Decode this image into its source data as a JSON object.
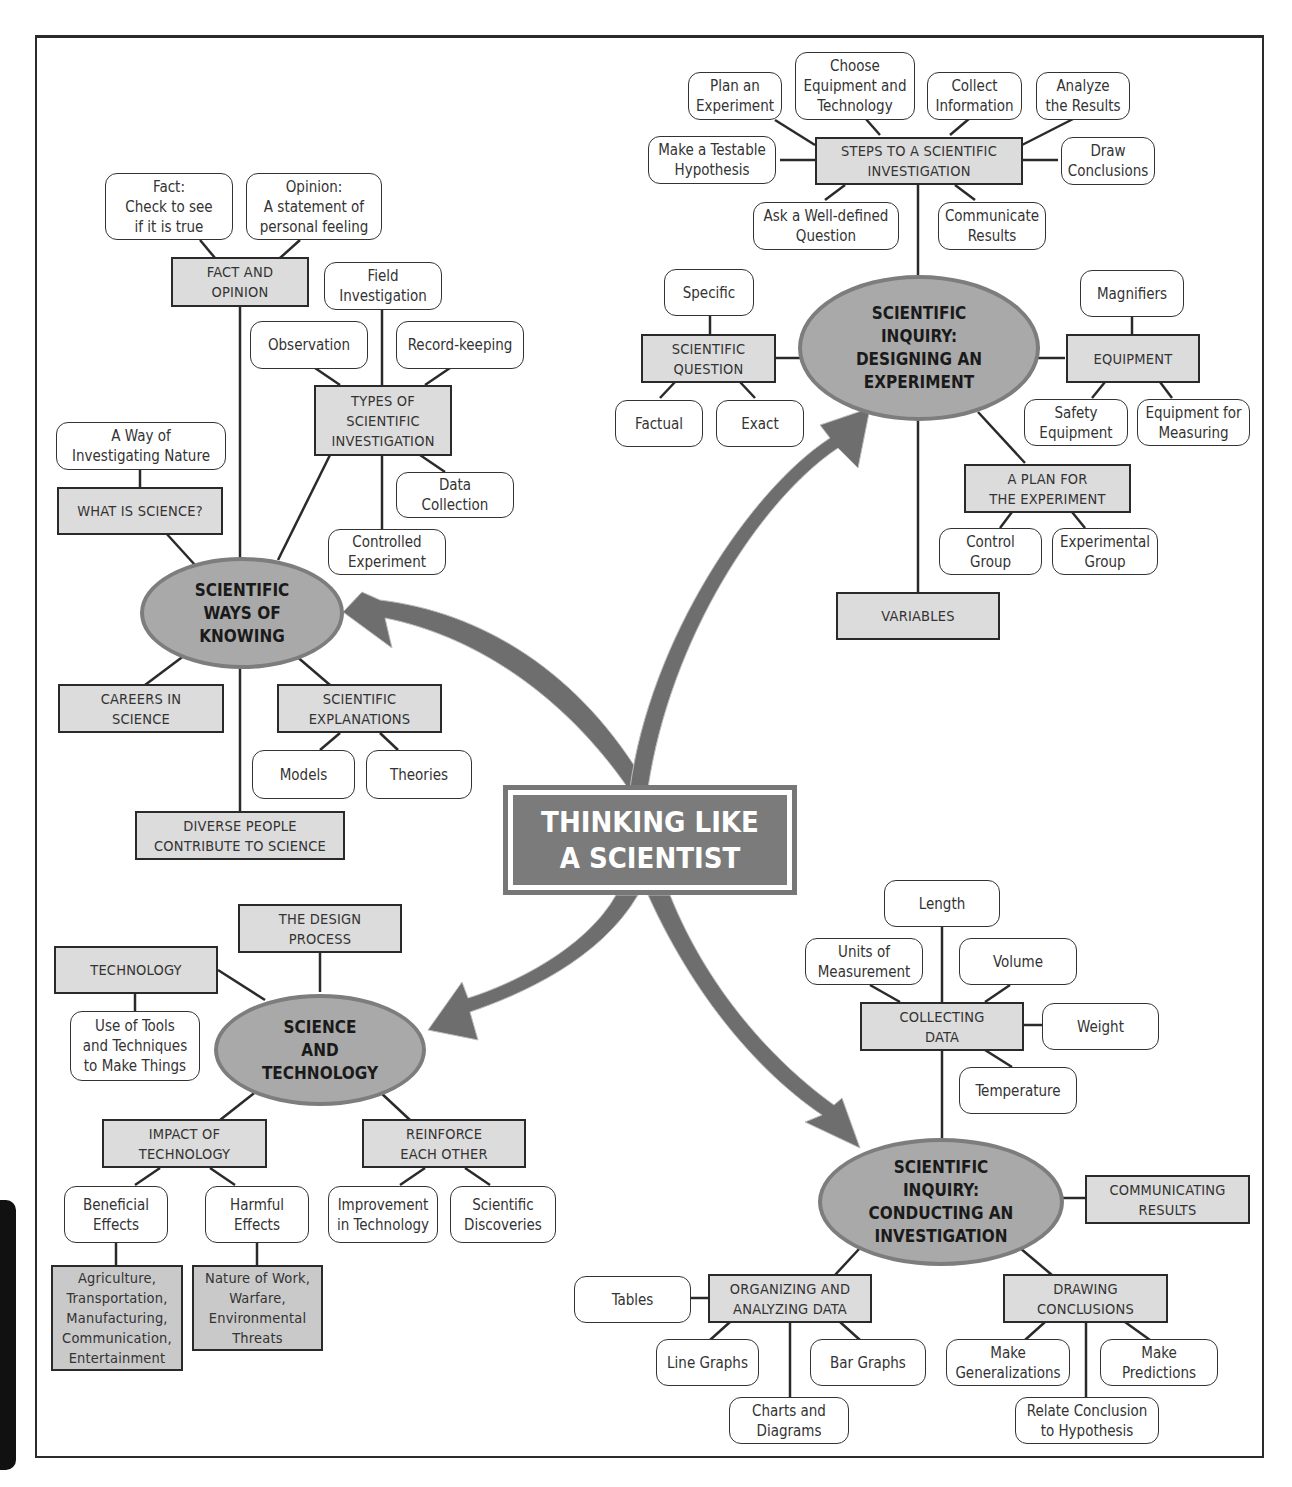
{
  "title": "THINKING LIKE\nA SCIENTIST",
  "colors": {
    "hub_fill": "#a9a9a9",
    "hub_border": "#7d7d7d",
    "box_fill": "#dcdcdc",
    "arrow": "#6e6e6e",
    "center_fill": "#7b7b7b"
  },
  "hubs": {
    "ways_of_knowing": "SCIENTIFIC\nWAYS OF\nKNOWING",
    "designing": "SCIENTIFIC\nINQUIRY:\nDESIGNING AN\nEXPERIMENT",
    "science_tech": "SCIENCE\nAND\nTECHNOLOGY",
    "conducting": "SCIENTIFIC\nINQUIRY:\nCONDUCTING AN\nINVESTIGATION"
  },
  "ways_of_knowing": {
    "fact_opinion": {
      "label": "FACT AND\nOPINION",
      "fact": "Fact:\nCheck to see\nif it is true",
      "opinion": "Opinion:\nA statement of\npersonal feeling"
    },
    "what_is_science": {
      "label": "WHAT IS SCIENCE?",
      "child": "A Way of\nInvestigating Nature"
    },
    "types": {
      "label": "TYPES OF\nSCIENTIFIC\nINVESTIGATION",
      "field": "Field\nInvestigation",
      "observation": "Observation",
      "record": "Record-keeping",
      "data": "Data\nCollection",
      "controlled": "Controlled\nExperiment"
    },
    "careers": "CAREERS IN\nSCIENCE",
    "explanations": {
      "label": "SCIENTIFIC\nEXPLANATIONS",
      "models": "Models",
      "theories": "Theories"
    },
    "diverse": "DIVERSE PEOPLE\nCONTRIBUTE TO SCIENCE"
  },
  "designing": {
    "steps": {
      "label": "STEPS TO A SCIENTIFIC\nINVESTIGATION",
      "items": [
        "Plan an\nExperiment",
        "Choose\nEquipment and\nTechnology",
        "Collect\nInformation",
        "Analyze\nthe Results",
        "Make a Testable\nHypothesis",
        "Draw\nConclusions",
        "Ask a Well-defined\nQuestion",
        "Communicate\nResults"
      ]
    },
    "question": {
      "label": "SCIENTIFIC\nQUESTION",
      "specific": "Specific",
      "factual": "Factual",
      "exact": "Exact"
    },
    "equipment": {
      "label": "EQUIPMENT",
      "magnifiers": "Magnifiers",
      "safety": "Safety\nEquipment",
      "measuring": "Equipment for\nMeasuring"
    },
    "plan": {
      "label": "A PLAN FOR\nTHE EXPERIMENT",
      "control": "Control\nGroup",
      "experimental": "Experimental\nGroup"
    },
    "variables": "VARIABLES"
  },
  "science_tech": {
    "design_process": "THE DESIGN\nPROCESS",
    "technology": {
      "label": "TECHNOLOGY",
      "child": "Use of Tools\nand Techniques\nto Make Things"
    },
    "impact": {
      "label": "IMPACT OF\nTECHNOLOGY",
      "beneficial": "Beneficial\nEffects",
      "harmful": "Harmful\nEffects",
      "beneficial_list": "Agriculture,\nTransportation,\nManufacturing,\nCommunication,\nEntertainment",
      "harmful_list": "Nature of Work,\nWarfare,\nEnvironmental\nThreats"
    },
    "reinforce": {
      "label": "REINFORCE\nEACH OTHER",
      "improvement": "Improvement\nin Technology",
      "discoveries": "Scientific\nDiscoveries"
    }
  },
  "conducting": {
    "collecting": {
      "label": "COLLECTING\nDATA",
      "length": "Length",
      "units": "Units of\nMeasurement",
      "volume": "Volume",
      "weight": "Weight",
      "temperature": "Temperature"
    },
    "communicating": "COMMUNICATING\nRESULTS",
    "organizing": {
      "label": "ORGANIZING AND\nANALYZING DATA",
      "tables": "Tables",
      "line": "Line Graphs",
      "bar": "Bar Graphs",
      "charts": "Charts and\nDiagrams"
    },
    "drawing": {
      "label": "DRAWING\nCONCLUSIONS",
      "generalizations": "Make\nGeneralizations",
      "predictions": "Make\nPredictions",
      "relate": "Relate Conclusion\nto Hypothesis"
    }
  }
}
